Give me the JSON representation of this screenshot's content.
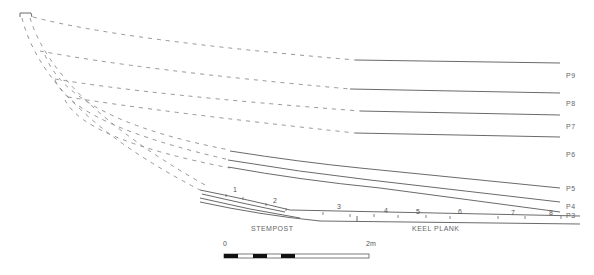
{
  "strakes": [
    "P9",
    "P8",
    "P7",
    "P6",
    "P5",
    "P4",
    "P3"
  ],
  "frame_numbers": [
    "1",
    "2",
    "3",
    "4",
    "5",
    "6",
    "7",
    "8"
  ],
  "labels": {
    "stempost": "STEMPOST",
    "keel_plank": "KEEL  PLANK"
  },
  "scale": {
    "start": "0",
    "end": "2m"
  }
}
